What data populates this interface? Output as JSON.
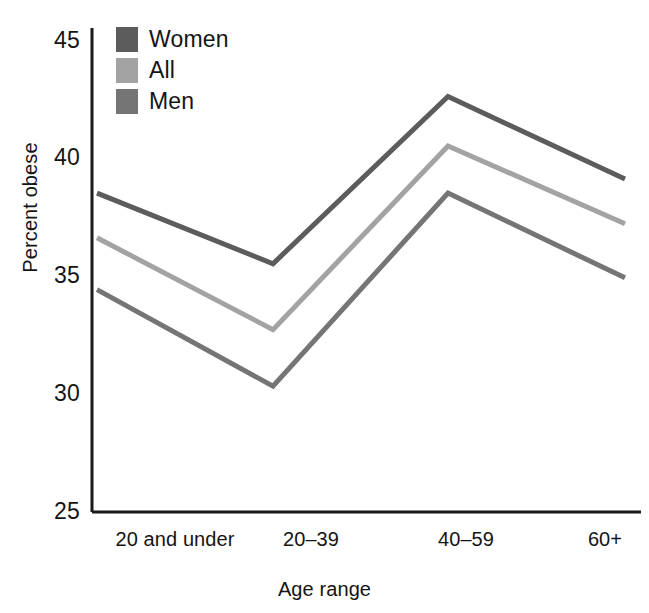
{
  "chart_data": {
    "type": "line",
    "title": "",
    "xlabel": "Age range",
    "ylabel": "Percent obese",
    "categories": [
      "20 and under",
      "20–39",
      "40–59",
      "60+"
    ],
    "yticks": [
      45,
      40,
      35,
      30,
      25
    ],
    "ylim": [
      25,
      46
    ],
    "grid": false,
    "legend_position": "top-left-inside",
    "series": [
      {
        "name": "Women",
        "color": "#5c5c5c",
        "values": [
          38.5,
          35.5,
          42.6,
          39.1
        ]
      },
      {
        "name": "All",
        "color": "#a3a3a3",
        "values": [
          36.6,
          32.7,
          40.5,
          37.2
        ]
      },
      {
        "name": "Men",
        "color": "#757575",
        "values": [
          34.4,
          30.3,
          38.5,
          34.9
        ]
      }
    ]
  },
  "axes": {
    "spine_color": "#1a1a1a",
    "tick_label_0": "45",
    "tick_label_1": "40",
    "tick_label_2": "35",
    "tick_label_3": "30",
    "tick_label_4": "25",
    "xtick_label_0": "20 and under",
    "xtick_label_1": "20–39",
    "xtick_label_2": "40–59",
    "xtick_label_3": "60+"
  },
  "legend": {
    "items": [
      {
        "label": "Women",
        "color": "#5c5c5c"
      },
      {
        "label": "All",
        "color": "#a3a3a3"
      },
      {
        "label": "Men",
        "color": "#757575"
      }
    ]
  }
}
